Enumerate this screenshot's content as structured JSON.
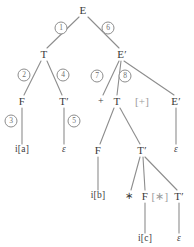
{
  "diagram": {
    "type": "parse-tree",
    "colors": {
      "background": "#ffffff",
      "node_text": "#3a3a3a",
      "edge": "#8d8d8d",
      "step_circle": "#8d8d8d",
      "step_text": "#6f6f6f",
      "dimmed_text": "#9b9b9b"
    },
    "nodes": [
      {
        "id": "n0",
        "label": "E",
        "x": 83,
        "y": 10,
        "kind": "nonterminal"
      },
      {
        "id": "n1",
        "label": "T",
        "x": 44,
        "y": 54,
        "kind": "nonterminal"
      },
      {
        "id": "n2",
        "label": "E′",
        "x": 122,
        "y": 54,
        "kind": "nonterminal"
      },
      {
        "id": "n3",
        "label": "F",
        "x": 22,
        "y": 101,
        "kind": "nonterminal"
      },
      {
        "id": "n4",
        "label": "T′",
        "x": 64,
        "y": 101,
        "kind": "nonterminal"
      },
      {
        "id": "n5",
        "label": "i[a]",
        "x": 22,
        "y": 150,
        "kind": "terminal"
      },
      {
        "id": "n6",
        "label": "ε",
        "x": 64,
        "y": 150,
        "kind": "epsilon"
      },
      {
        "id": "n7",
        "label": "+",
        "x": 101,
        "y": 101,
        "kind": "operator"
      },
      {
        "id": "n8",
        "label": "T",
        "x": 117,
        "y": 101,
        "kind": "nonterminal"
      },
      {
        "id": "n9",
        "label": "[+]",
        "x": 142,
        "y": 101,
        "kind": "annotation"
      },
      {
        "id": "n10",
        "label": "E′",
        "x": 176,
        "y": 101,
        "kind": "nonterminal"
      },
      {
        "id": "n11",
        "label": "ε",
        "x": 176,
        "y": 150,
        "kind": "epsilon"
      },
      {
        "id": "n12",
        "label": "F",
        "x": 98,
        "y": 150,
        "kind": "nonterminal"
      },
      {
        "id": "n13",
        "label": "T′",
        "x": 142,
        "y": 150,
        "kind": "nonterminal"
      },
      {
        "id": "n14",
        "label": "i[b]",
        "x": 98,
        "y": 196,
        "kind": "terminal"
      },
      {
        "id": "n15",
        "label": "∗",
        "x": 129,
        "y": 196,
        "kind": "operator"
      },
      {
        "id": "n16",
        "label": "F",
        "x": 145,
        "y": 196,
        "kind": "nonterminal"
      },
      {
        "id": "n17",
        "label": "[∗]",
        "x": 160,
        "y": 196,
        "kind": "annotation"
      },
      {
        "id": "n18",
        "label": "T′",
        "x": 179,
        "y": 196,
        "kind": "nonterminal"
      },
      {
        "id": "n19",
        "label": "i[c]",
        "x": 145,
        "y": 239,
        "kind": "terminal"
      },
      {
        "id": "n20",
        "label": "ε",
        "x": 179,
        "y": 239,
        "kind": "epsilon"
      }
    ],
    "edges": [
      {
        "from": "n0",
        "to": "n1",
        "x1": 79,
        "y1": 17,
        "x2": 47,
        "y2": 48
      },
      {
        "from": "n0",
        "to": "n2",
        "x1": 88,
        "y1": 17,
        "x2": 119,
        "y2": 48
      },
      {
        "from": "n1",
        "to": "n3",
        "x1": 41,
        "y1": 61,
        "x2": 24,
        "y2": 95
      },
      {
        "from": "n1",
        "to": "n4",
        "x1": 47,
        "y1": 61,
        "x2": 62,
        "y2": 95
      },
      {
        "from": "n3",
        "to": "n5",
        "x1": 22,
        "y1": 108,
        "x2": 22,
        "y2": 144
      },
      {
        "from": "n4",
        "to": "n6",
        "x1": 64,
        "y1": 108,
        "x2": 64,
        "y2": 144
      },
      {
        "from": "n2",
        "to": "n7",
        "x1": 119,
        "y1": 61,
        "x2": 103,
        "y2": 95
      },
      {
        "from": "n2",
        "to": "n8",
        "x1": 121,
        "y1": 61,
        "x2": 117,
        "y2": 95
      },
      {
        "from": "n2",
        "to": "n10",
        "x1": 124,
        "y1": 61,
        "x2": 174,
        "y2": 95
      },
      {
        "from": "n10",
        "to": "n11",
        "x1": 176,
        "y1": 108,
        "x2": 176,
        "y2": 144
      },
      {
        "from": "n8",
        "to": "n12",
        "x1": 114,
        "y1": 108,
        "x2": 100,
        "y2": 144
      },
      {
        "from": "n8",
        "to": "n13",
        "x1": 120,
        "y1": 108,
        "x2": 140,
        "y2": 144
      },
      {
        "from": "n12",
        "to": "n14",
        "x1": 98,
        "y1": 157,
        "x2": 98,
        "y2": 190
      },
      {
        "from": "n13",
        "to": "n15",
        "x1": 140,
        "y1": 157,
        "x2": 131,
        "y2": 190
      },
      {
        "from": "n13",
        "to": "n16",
        "x1": 143,
        "y1": 157,
        "x2": 145,
        "y2": 190
      },
      {
        "from": "n13",
        "to": "n18",
        "x1": 145,
        "y1": 157,
        "x2": 177,
        "y2": 190
      },
      {
        "from": "n16",
        "to": "n19",
        "x1": 145,
        "y1": 203,
        "x2": 145,
        "y2": 233
      },
      {
        "from": "n18",
        "to": "n20",
        "x1": 179,
        "y1": 203,
        "x2": 179,
        "y2": 233
      }
    ],
    "steps": [
      {
        "label": "1",
        "x": 61,
        "y": 28
      },
      {
        "label": "6",
        "x": 108,
        "y": 28
      },
      {
        "label": "2",
        "x": 24,
        "y": 75
      },
      {
        "label": "4",
        "x": 63,
        "y": 75
      },
      {
        "label": "3",
        "x": 11,
        "y": 121
      },
      {
        "label": "5",
        "x": 74,
        "y": 121
      },
      {
        "label": "7",
        "x": 97,
        "y": 76
      },
      {
        "label": "8",
        "x": 125,
        "y": 76
      }
    ]
  }
}
